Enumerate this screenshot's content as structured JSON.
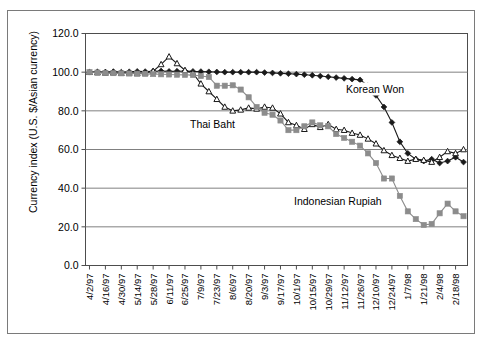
{
  "chart_data": {
    "type": "line",
    "title": "",
    "xlabel": "",
    "ylabel": "Currency index (U.S. $/Asian currency)",
    "ylim": [
      0,
      120
    ],
    "ytick_step": 20,
    "yticks": [
      "0.0",
      "20.0",
      "40.0",
      "60.0",
      "80.0",
      "100.0",
      "120.0"
    ],
    "grid": true,
    "legend_position": "inline-annotations",
    "categories": [
      "4/2/97",
      "4/9/97",
      "4/16/97",
      "4/23/97",
      "4/30/97",
      "5/7/97",
      "5/14/97",
      "5/21/97",
      "5/28/97",
      "6/4/97",
      "6/11/97",
      "6/18/97",
      "6/25/97",
      "7/2/97",
      "7/9/97",
      "7/16/97",
      "7/23/97",
      "7/30/97",
      "8/6/97",
      "8/13/97",
      "8/20/97",
      "8/27/97",
      "9/3/97",
      "9/10/97",
      "9/17/97",
      "9/24/97",
      "10/1/97",
      "10/8/97",
      "10/15/97",
      "10/22/97",
      "10/29/97",
      "11/5/97",
      "11/12/97",
      "11/19/97",
      "11/26/97",
      "12/3/97",
      "12/10/97",
      "12/17/97",
      "12/24/97",
      "12/31/97",
      "1/7/98",
      "1/14/98",
      "1/21/98",
      "1/28/98",
      "2/4/98",
      "2/11/98",
      "2/18/98",
      "2/25/98"
    ],
    "xtick_labels": [
      "4/2/97",
      "4/16/97",
      "4/30/97",
      "5/14/97",
      "5/28/97",
      "6/11/97",
      "6/25/97",
      "7/9/97",
      "7/23/97",
      "8/6/97",
      "8/20/97",
      "9/3/97",
      "9/17/97",
      "10/1/97",
      "10/15/97",
      "10/29/97",
      "11/12/97",
      "11/26/97",
      "12/10/97",
      "12/24/97",
      "1/7/98",
      "1/21/98",
      "2/4/98",
      "2/18/98"
    ],
    "series": [
      {
        "name": "Korean Won",
        "marker": "filled-diamond",
        "color": "#1a1a1a",
        "values": [
          100.0,
          100.2,
          100.1,
          100.3,
          100.0,
          100.2,
          100.4,
          100.3,
          100.5,
          100.6,
          100.4,
          100.5,
          100.6,
          100.4,
          100.3,
          100.2,
          100.1,
          100.0,
          100.0,
          100.0,
          100.0,
          100.0,
          99.8,
          99.6,
          99.4,
          99.2,
          99.0,
          98.7,
          98.4,
          98.0,
          97.6,
          97.2,
          96.8,
          96.4,
          96.0,
          93.0,
          88.0,
          82.0,
          74.0,
          64.0,
          58.0,
          55.0,
          54.0,
          55.0,
          53.0,
          54.0,
          56.0,
          53.5
        ]
      },
      {
        "name": "Thai Baht",
        "marker": "open-triangle",
        "color": "#1a1a1a",
        "values": [
          100.0,
          99.8,
          99.6,
          99.7,
          99.5,
          99.6,
          99.4,
          99.6,
          100.5,
          104.0,
          108.0,
          104.5,
          101.0,
          99.5,
          94.0,
          90.0,
          86.0,
          82.0,
          80.0,
          80.5,
          81.5,
          81.0,
          82.0,
          81.5,
          78.5,
          74.0,
          72.5,
          70.5,
          73.0,
          71.5,
          73.0,
          70.5,
          70.0,
          68.5,
          67.5,
          65.5,
          63.0,
          59.5,
          57.0,
          55.5,
          54.0,
          55.0,
          54.5,
          53.5,
          56.0,
          59.0,
          58.0,
          60.0
        ]
      },
      {
        "name": "Indonesian Rupiah",
        "marker": "filled-square",
        "color": "#8c8c8c",
        "values": [
          100.0,
          99.8,
          99.6,
          99.5,
          99.4,
          99.3,
          99.2,
          99.1,
          99.0,
          98.9,
          98.8,
          98.7,
          98.6,
          98.5,
          98.0,
          97.5,
          93.0,
          93.0,
          93.2,
          91.0,
          87.0,
          82.0,
          79.0,
          78.0,
          75.0,
          70.0,
          70.0,
          72.0,
          74.0,
          72.5,
          72.0,
          68.0,
          66.0,
          64.0,
          62.0,
          58.0,
          53.0,
          45.0,
          45.0,
          36.0,
          28.0,
          24.0,
          21.0,
          21.5,
          27.0,
          32.0,
          28.0,
          25.5
        ]
      }
    ],
    "annotations": [
      {
        "text": "Korean Won",
        "series": "Korean Won"
      },
      {
        "text": "Thai Baht",
        "series": "Thai Baht"
      },
      {
        "text": "Indonesian Rupiah",
        "series": "Indonesian Rupiah"
      }
    ]
  }
}
